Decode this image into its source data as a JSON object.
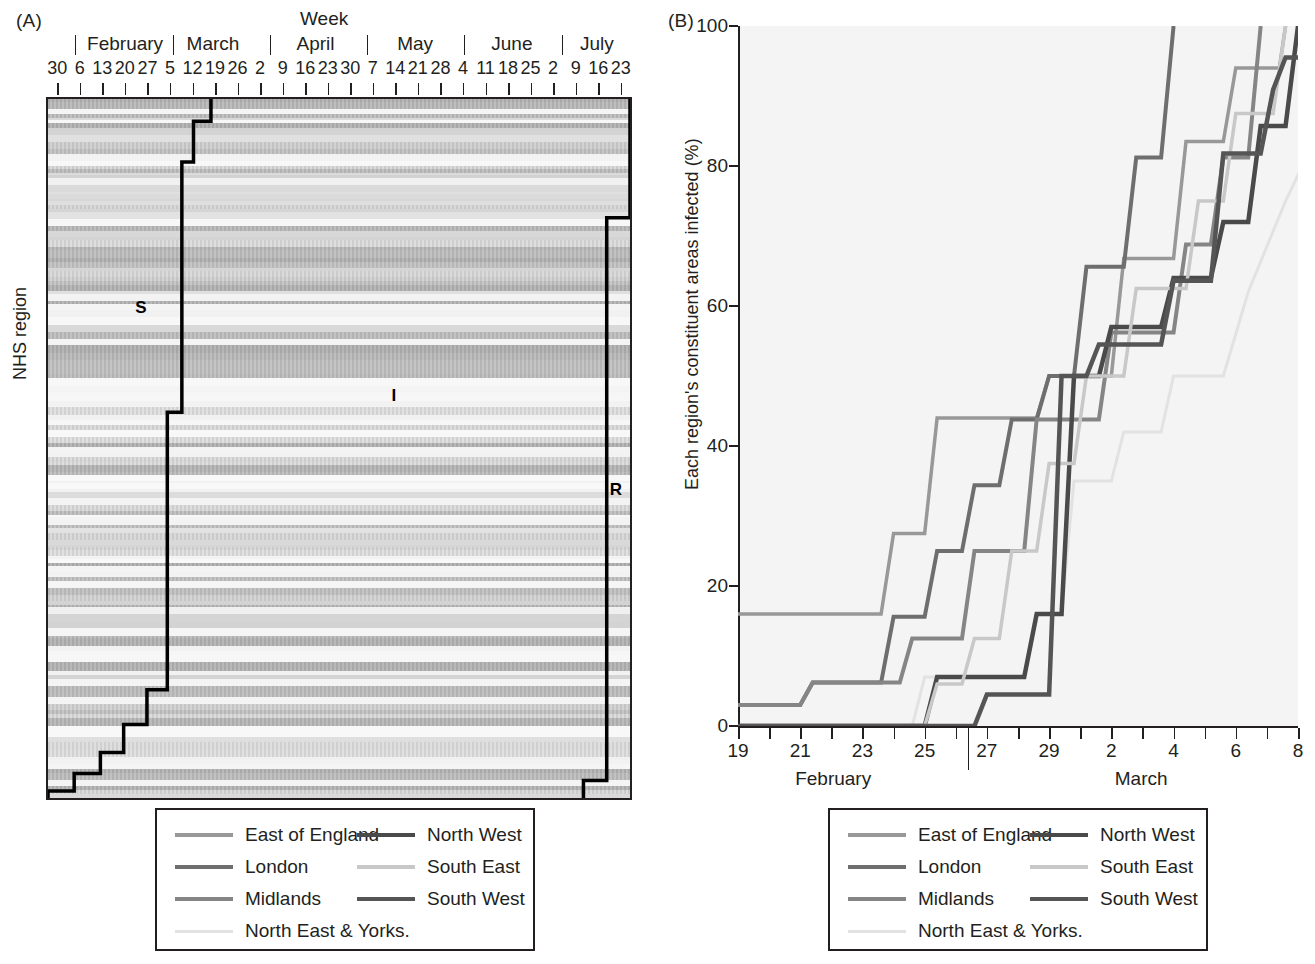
{
  "figure": {
    "panel_a_tag": "(A)",
    "panel_b_tag": "(B)"
  },
  "panel_a": {
    "title": "Week",
    "ylabel": "NHS region",
    "months": [
      {
        "name": "February",
        "center_pct": 13.5
      },
      {
        "name": "March",
        "center_pct": 28.5
      },
      {
        "name": "April",
        "center_pct": 46.0
      },
      {
        "name": "May",
        "center_pct": 63.0
      },
      {
        "name": "June",
        "center_pct": 79.5
      },
      {
        "name": "July",
        "center_pct": 94.0
      }
    ],
    "month_separators_pct": [
      5.0,
      21.6,
      38.2,
      54.8,
      71.4,
      88.0
    ],
    "day_ticks": [
      "30",
      "6",
      "13",
      "20",
      "27",
      "5",
      "12",
      "19",
      "26",
      "2",
      "9",
      "16",
      "23",
      "30",
      "7",
      "14",
      "21",
      "28",
      "4",
      "11",
      "18",
      "25",
      "2",
      "9",
      "16",
      "23"
    ],
    "annotations": [
      {
        "text": "S",
        "x_pct": 15.0,
        "y_pct": 28.5
      },
      {
        "text": "I",
        "x_pct": 59.0,
        "y_pct": 41.0
      },
      {
        "text": "R",
        "x_pct": 96.5,
        "y_pct": 54.5
      }
    ]
  },
  "panel_b": {
    "ylabel": "Each region's constituent areas infected (%)",
    "y_ticks": [
      0,
      20,
      40,
      60,
      80,
      100
    ],
    "x_ticks": [
      19,
      20,
      21,
      22,
      23,
      24,
      25,
      26,
      27,
      28,
      29,
      1,
      2,
      3,
      4,
      5,
      6,
      7,
      8,
      9,
      10,
      11,
      12,
      13,
      14,
      15,
      16,
      17,
      18
    ],
    "x_tick_labels": [
      "19",
      "21",
      "23",
      "25",
      "27",
      "29",
      "2",
      "4",
      "6",
      "8",
      "10",
      "12",
      "14",
      "16",
      "18"
    ],
    "month_labels": [
      {
        "name": "February",
        "center_pct": 17.0
      },
      {
        "name": "March",
        "center_pct": 72.0
      }
    ],
    "month_divider_pct": 41.0
  },
  "legend": {
    "entries": [
      {
        "label": "East of England",
        "color": "#989898",
        "width": 3.5,
        "column": 0,
        "row": 0
      },
      {
        "label": "London",
        "color": "#6e6e6e",
        "width": 4.0,
        "column": 0,
        "row": 1
      },
      {
        "label": "Midlands",
        "color": "#858585",
        "width": 4.0,
        "column": 0,
        "row": 2
      },
      {
        "label": "North East & Yorks.",
        "color": "#e2e2e2",
        "width": 3.0,
        "column": 0,
        "row": 3
      },
      {
        "label": "North West",
        "color": "#4a4a4a",
        "width": 4.5,
        "column": 1,
        "row": 0
      },
      {
        "label": "South East",
        "color": "#c8c8c8",
        "width": 3.5,
        "column": 1,
        "row": 1
      },
      {
        "label": "South West",
        "color": "#555555",
        "width": 4.5,
        "column": 1,
        "row": 2
      }
    ]
  },
  "chart_data": [
    {
      "type": "heatmap",
      "title": "Week",
      "xlabel": "Week",
      "ylabel": "NHS region",
      "x_range": [
        "Jan 30",
        "Jul 23"
      ],
      "description": "Horizontal banded raster of NHS regions over weeks with a black step boundary separating S (susceptible), I (infected) and R (recovered) phases.",
      "annotations": [
        "S",
        "I",
        "R"
      ],
      "step_boundary_left": [
        [
          28.0,
          0.0
        ],
        [
          28.0,
          3.2
        ],
        [
          25.0,
          3.2
        ],
        [
          25.0,
          9.0
        ],
        [
          23.0,
          9.0
        ],
        [
          23.0,
          44.8
        ],
        [
          20.5,
          44.8
        ],
        [
          20.5,
          84.5
        ],
        [
          17.0,
          84.5
        ],
        [
          17.0,
          89.5
        ],
        [
          13.0,
          89.5
        ],
        [
          13.0,
          93.5
        ],
        [
          9.0,
          93.5
        ],
        [
          9.0,
          96.5
        ],
        [
          4.5,
          96.5
        ],
        [
          4.5,
          99.0
        ],
        [
          0.0,
          99.0
        ],
        [
          0.0,
          100.0
        ]
      ],
      "step_boundary_right": [
        [
          100.0,
          0.0
        ],
        [
          100.0,
          17.0
        ],
        [
          96.0,
          17.0
        ],
        [
          96.0,
          97.5
        ],
        [
          92.0,
          97.5
        ],
        [
          92.0,
          100.0
        ]
      ]
    },
    {
      "type": "line",
      "title": "",
      "xlabel": "Date (February - March)",
      "ylabel": "Each region's constituent areas infected (%)",
      "ylim": [
        0,
        100
      ],
      "xlim": [
        19,
        37
      ],
      "x_axis_note": "x values 19-29 are February days; 30 => March 1, 31 => March 2, ... 47 => March 18",
      "grid": false,
      "legend_position": "below",
      "series": [
        {
          "name": "East of England",
          "color": "#989898",
          "points": [
            [
              19,
              16.0
            ],
            [
              23.6,
              16.0
            ],
            [
              24.0,
              27.5
            ],
            [
              25.0,
              27.5
            ],
            [
              25.4,
              44.0
            ],
            [
              28.6,
              44.0
            ],
            [
              29.0,
              50.0
            ],
            [
              31.0,
              50.0
            ],
            [
              31.4,
              66.8
            ],
            [
              33.0,
              66.8
            ],
            [
              33.4,
              83.5
            ],
            [
              34.6,
              83.5
            ],
            [
              35.0,
              94.0
            ],
            [
              36.4,
              94.0
            ],
            [
              36.6,
              100.0
            ]
          ]
        },
        {
          "name": "London",
          "color": "#6e6e6e",
          "points": [
            [
              19,
              3.0
            ],
            [
              21.0,
              3.0
            ],
            [
              21.4,
              6.2
            ],
            [
              23.6,
              6.2
            ],
            [
              24.0,
              15.6
            ],
            [
              25.0,
              15.6
            ],
            [
              25.4,
              25.0
            ],
            [
              26.2,
              25.0
            ],
            [
              26.6,
              34.4
            ],
            [
              27.4,
              34.4
            ],
            [
              27.8,
              43.8
            ],
            [
              28.6,
              43.8
            ],
            [
              29.0,
              50.0
            ],
            [
              29.8,
              50.0
            ],
            [
              30.2,
              65.6
            ],
            [
              31.4,
              65.6
            ],
            [
              31.8,
              81.2
            ],
            [
              32.6,
              81.2
            ],
            [
              33.0,
              100.0
            ]
          ]
        },
        {
          "name": "Midlands",
          "color": "#858585",
          "points": [
            [
              19,
              3.0
            ],
            [
              21.0,
              3.0
            ],
            [
              21.4,
              6.2
            ],
            [
              24.2,
              6.2
            ],
            [
              24.6,
              12.5
            ],
            [
              26.2,
              12.5
            ],
            [
              26.6,
              25.0
            ],
            [
              28.2,
              25.0
            ],
            [
              28.6,
              43.8
            ],
            [
              30.6,
              43.8
            ],
            [
              31.0,
              56.2
            ],
            [
              33.0,
              56.2
            ],
            [
              33.4,
              68.8
            ],
            [
              34.2,
              68.8
            ],
            [
              34.6,
              81.2
            ],
            [
              35.4,
              81.2
            ],
            [
              35.8,
              100.0
            ]
          ]
        },
        {
          "name": "North East & Yorks.",
          "color": "#e2e2e2",
          "points": [
            [
              19,
              0.0
            ],
            [
              24.6,
              0.0
            ],
            [
              25.0,
              7.0
            ],
            [
              28.2,
              7.0
            ],
            [
              28.6,
              16.0
            ],
            [
              29.4,
              16.0
            ],
            [
              29.8,
              35.0
            ],
            [
              31.0,
              35.0
            ],
            [
              31.4,
              42.0
            ],
            [
              32.6,
              42.0
            ],
            [
              33.0,
              50.0
            ],
            [
              34.6,
              50.0
            ],
            [
              35.4,
              62.0
            ],
            [
              36.6,
              75.0
            ],
            [
              38.0,
              88.0
            ],
            [
              39.4,
              96.0
            ],
            [
              41.0,
              96.0
            ]
          ]
        },
        {
          "name": "North West",
          "color": "#4a4a4a",
          "points": [
            [
              19,
              0.0
            ],
            [
              25.0,
              0.0
            ],
            [
              25.4,
              7.0
            ],
            [
              28.2,
              7.0
            ],
            [
              28.6,
              16.0
            ],
            [
              29.4,
              16.0
            ],
            [
              29.8,
              50.0
            ],
            [
              30.6,
              50.0
            ],
            [
              31.0,
              57.0
            ],
            [
              32.6,
              57.0
            ],
            [
              33.0,
              64.0
            ],
            [
              34.2,
              64.0
            ],
            [
              34.6,
              72.0
            ],
            [
              35.4,
              72.0
            ],
            [
              35.8,
              85.7
            ],
            [
              36.6,
              85.7
            ],
            [
              37.0,
              100.0
            ]
          ]
        },
        {
          "name": "South East",
          "color": "#c8c8c8",
          "points": [
            [
              19,
              0.0
            ],
            [
              25.0,
              0.0
            ],
            [
              25.4,
              6.0
            ],
            [
              26.2,
              6.0
            ],
            [
              26.6,
              12.5
            ],
            [
              27.4,
              12.5
            ],
            [
              27.8,
              25.0
            ],
            [
              28.6,
              25.0
            ],
            [
              29.0,
              37.5
            ],
            [
              29.8,
              37.5
            ],
            [
              30.2,
              50.0
            ],
            [
              31.4,
              50.0
            ],
            [
              31.8,
              62.5
            ],
            [
              33.4,
              62.5
            ],
            [
              33.8,
              75.0
            ],
            [
              34.6,
              75.0
            ],
            [
              35.0,
              87.5
            ],
            [
              36.2,
              87.5
            ],
            [
              36.6,
              100.0
            ]
          ]
        },
        {
          "name": "South West",
          "color": "#555555",
          "points": [
            [
              19,
              0.0
            ],
            [
              26.6,
              0.0
            ],
            [
              27.0,
              4.5
            ],
            [
              29.0,
              4.5
            ],
            [
              29.4,
              50.0
            ],
            [
              30.2,
              50.0
            ],
            [
              30.6,
              54.5
            ],
            [
              32.6,
              54.5
            ],
            [
              33.0,
              63.6
            ],
            [
              34.2,
              63.6
            ],
            [
              34.6,
              81.8
            ],
            [
              35.8,
              81.8
            ],
            [
              36.2,
              90.9
            ],
            [
              36.6,
              95.5
            ],
            [
              37.4,
              95.5
            ]
          ]
        }
      ]
    }
  ]
}
